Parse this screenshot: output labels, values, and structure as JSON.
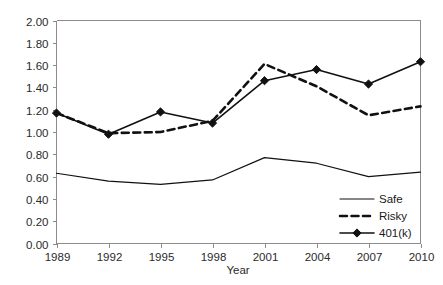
{
  "chart_data": {
    "type": "line",
    "title": "",
    "xlabel": "Year",
    "ylabel": "",
    "categories": [
      "1989",
      "1992",
      "1995",
      "1998",
      "2001",
      "2004",
      "2007",
      "2010"
    ],
    "x": [
      1989,
      1992,
      1995,
      1998,
      2001,
      2004,
      2007,
      2010
    ],
    "series": [
      {
        "name": "Safe",
        "style": "solid-thin",
        "marker": "none",
        "color": "#111111",
        "values": [
          0.63,
          0.56,
          0.53,
          0.57,
          0.77,
          0.72,
          0.6,
          0.64
        ]
      },
      {
        "name": "Risky",
        "style": "dashed-thick",
        "marker": "none",
        "color": "#111111",
        "values": [
          1.17,
          0.99,
          1.0,
          1.1,
          1.61,
          1.41,
          1.15,
          1.23
        ]
      },
      {
        "name": "401(k)",
        "style": "solid-with-markers",
        "marker": "diamond",
        "color": "#111111",
        "values": [
          1.17,
          0.98,
          1.18,
          1.08,
          1.46,
          1.56,
          1.43,
          1.63
        ]
      }
    ],
    "ylim": [
      0.0,
      2.0
    ],
    "ytick_step": 0.2,
    "ytick_labels": [
      "0.00",
      "0.20",
      "0.40",
      "0.60",
      "0.80",
      "1.00",
      "1.20",
      "1.40",
      "1.60",
      "1.80",
      "2.00"
    ],
    "xtick_labels": [
      "1989",
      "1992",
      "1995",
      "1998",
      "2001",
      "2004",
      "2007",
      "2010"
    ],
    "grid": false,
    "legend_position": "bottom-right",
    "legend_entries": [
      "Safe",
      "Risky",
      "401(k)"
    ]
  },
  "axis": {
    "y_title": "",
    "x_title": "Year"
  },
  "legend": {
    "items": [
      {
        "label": "Safe"
      },
      {
        "label": "Risky"
      },
      {
        "label": "401(k)"
      }
    ]
  }
}
